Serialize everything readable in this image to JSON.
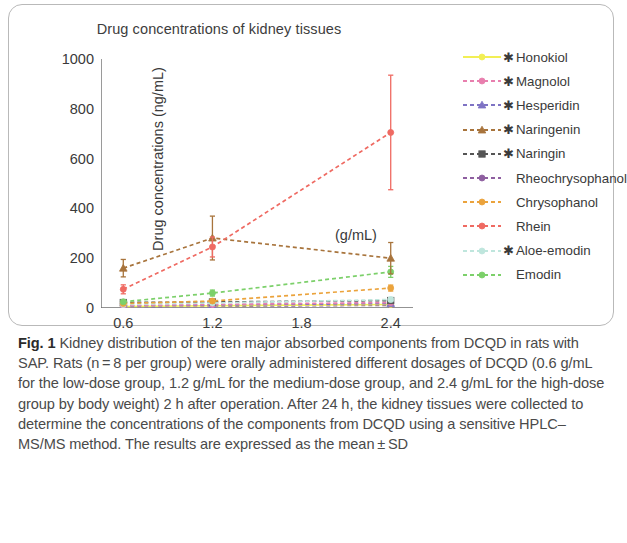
{
  "figure": {
    "panel_title": "Drug concentrations of kidney tissues",
    "y_axis_title": "Drug concentrations (ng/mL)",
    "x_axis_unit": "(g/mL)"
  },
  "caption": {
    "label": "Fig. 1",
    "text": "Kidney distribution of the ten major absorbed components from DCQD in rats with SAP. Rats (n = 8 per group) were orally administered different dosages of DCQD (0.6 g/mL for the low-dose group, 1.2 g/mL for the medium-dose group, and 2.4 g/mL for the high-dose group by body weight) 2 h after operation. After 24 h, the kidney tissues were collected to determine the concentrations of the components from DCQD using a sensitive HPLC–MS/MS method. The results are expressed as the mean ± SD"
  },
  "legend": {
    "star_glyph": "✱",
    "entries": [
      {
        "label": "Honokiol",
        "color": "#f2ef55",
        "starred": true,
        "marker": "circle",
        "dashed": false
      },
      {
        "label": "Magnolol",
        "color": "#e87fae",
        "starred": true,
        "marker": "circle",
        "dashed": true
      },
      {
        "label": "Hesperidin",
        "color": "#7e73c4",
        "starred": true,
        "marker": "triangle",
        "dashed": true
      },
      {
        "label": "Naringenin",
        "color": "#a8743c",
        "starred": true,
        "marker": "triangle",
        "dashed": true
      },
      {
        "label": "Naringin",
        "color": "#555555",
        "starred": true,
        "marker": "square",
        "dashed": true
      },
      {
        "label": "Rheochrysophanol",
        "color": "#8e5fa0",
        "starred": false,
        "marker": "circle",
        "dashed": true
      },
      {
        "label": "Chrysophanol",
        "color": "#eba33c",
        "starred": false,
        "marker": "circle",
        "dashed": true
      },
      {
        "label": "Rhein",
        "color": "#ef6a62",
        "starred": false,
        "marker": "circle",
        "dashed": true
      },
      {
        "label": "Aloe-emodin",
        "color": "#bfe6dd",
        "starred": true,
        "marker": "circle",
        "dashed": true
      },
      {
        "label": "Emodin",
        "color": "#7cd06a",
        "starred": false,
        "marker": "circle",
        "dashed": true
      }
    ]
  },
  "chart_data": {
    "type": "line",
    "title": "Drug concentrations of kidney tissues",
    "xlabel": "(g/mL)",
    "ylabel": "Drug concentrations (ng/mL)",
    "x": [
      0.6,
      1.2,
      2.4
    ],
    "x_tick_labels": [
      "0.6",
      "1.2",
      "1.8",
      "2.4"
    ],
    "x_tick_values": [
      0.6,
      1.2,
      1.8,
      2.4
    ],
    "xlim": [
      0.45,
      2.55
    ],
    "ylim": [
      0,
      1000
    ],
    "y_tick_values": [
      0,
      200,
      400,
      600,
      800,
      1000
    ],
    "y_tick_labels": [
      "0",
      "200",
      "400",
      "600",
      "800",
      "1000"
    ],
    "grid": false,
    "legend_position": "right",
    "error_bars": "mean ± SD",
    "series": [
      {
        "name": "Honokiol",
        "color": "#f2ef55",
        "marker": "circle",
        "dashed": false,
        "values": [
          6,
          9,
          14
        ],
        "err": [
          3,
          4,
          5
        ]
      },
      {
        "name": "Magnolol",
        "color": "#e87fae",
        "marker": "circle",
        "dashed": true,
        "values": [
          10,
          14,
          22
        ],
        "err": [
          4,
          5,
          7
        ]
      },
      {
        "name": "Hesperidin",
        "color": "#7e73c4",
        "marker": "triangle",
        "dashed": true,
        "values": [
          8,
          12,
          18
        ],
        "err": [
          3,
          4,
          6
        ]
      },
      {
        "name": "Naringenin",
        "color": "#a8743c",
        "marker": "triangle",
        "dashed": true,
        "values": [
          160,
          281,
          200
        ],
        "err": [
          35,
          88,
          63
        ]
      },
      {
        "name": "Naringin",
        "color": "#555555",
        "marker": "square",
        "dashed": true,
        "values": [
          22,
          24,
          30
        ],
        "err": [
          6,
          7,
          8
        ]
      },
      {
        "name": "Rheochrysophanol",
        "color": "#8e5fa0",
        "marker": "circle",
        "dashed": true,
        "values": [
          5,
          7,
          11
        ],
        "err": [
          2,
          3,
          4
        ]
      },
      {
        "name": "Chrysophanol",
        "color": "#eba33c",
        "marker": "circle",
        "dashed": true,
        "values": [
          18,
          28,
          80
        ],
        "err": [
          5,
          7,
          12
        ]
      },
      {
        "name": "Rhein",
        "color": "#ef6a62",
        "marker": "circle",
        "dashed": true,
        "values": [
          75,
          245,
          705
        ],
        "err": [
          18,
          40,
          230
        ]
      },
      {
        "name": "Aloe-emodin",
        "color": "#bfe6dd",
        "marker": "circle",
        "dashed": true,
        "values": [
          14,
          20,
          34
        ],
        "err": [
          4,
          5,
          8
        ]
      },
      {
        "name": "Emodin",
        "color": "#7cd06a",
        "marker": "circle",
        "dashed": true,
        "values": [
          25,
          60,
          145
        ],
        "err": [
          7,
          12,
          22
        ]
      }
    ]
  }
}
